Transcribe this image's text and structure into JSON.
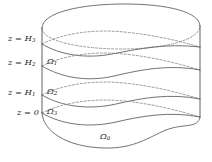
{
  "figure": {
    "kind": "layered-cylinder-domain-diagram",
    "stroke_color": "#4a4a4a",
    "dash_color": "#7a7a7a",
    "background": "#ffffff",
    "label_color": "#1a1a1a"
  },
  "height_labels": [
    {
      "id": "H3",
      "text": "z = H",
      "sub": "3",
      "x": 8,
      "y": 34
    },
    {
      "id": "H2",
      "text": "z = H",
      "sub": "2",
      "x": 8,
      "y": 58
    },
    {
      "id": "H1",
      "text": "z = H",
      "sub": "1",
      "x": 8,
      "y": 88
    },
    {
      "id": "H0",
      "text": "z = 0",
      "sub": "",
      "x": 17,
      "y": 108
    }
  ],
  "domain_labels": [
    {
      "id": "omega1",
      "text": "Ω",
      "sub": "1",
      "x": 47,
      "y": 57
    },
    {
      "id": "omega2",
      "text": "Ω",
      "sub": "2",
      "x": 47,
      "y": 87
    },
    {
      "id": "omega3",
      "text": "Ω",
      "sub": "3",
      "x": 47,
      "y": 107
    },
    {
      "id": "omega0",
      "text": "Ω",
      "sub": "0",
      "x": 100,
      "y": 132
    }
  ],
  "geometry": {
    "top_rim_solid": "M 42,28 C 42,12 82,4 124,4 C 168,4 200,12 200,26 C 200,40 164,48 122,48 C 80,48 42,40 42,28 Z",
    "interface_H3": "M 42,45 C 60,56 86,60 112,55 C 138,50 166,44 200,48",
    "interface_H3_b": "M 42,45 C 62,34 92,30 122,33 C 152,36 180,42 200,48",
    "interface_H2": "M 42,66 C 62,78 88,82 114,76 C 140,70 168,64 200,70",
    "interface_H2_b": "M 42,66 C 62,55 92,51 122,54 C 152,57 180,64 200,70",
    "interface_H1": "M 42,95 C 62,107 90,110 116,104 C 142,98 170,93 200,99",
    "interface_H1_b": "M 42,95 C 62,84 92,80 122,83 C 152,86 180,93 200,99",
    "interface_H0": "M 42,113 C 62,125 90,128 116,122 C 142,116 170,111 200,117",
    "interface_H0_b": "M 42,113 C 62,102 92,98 122,101 C 152,104 180,111 200,117",
    "base_front": "M 42,113 C 44,130 66,146 104,147 C 136,148 150,136 166,130 C 184,123 198,128 200,117",
    "left_generator": "M 42,28 L 42,113",
    "right_generator": "M 200,26 L 200,117"
  }
}
